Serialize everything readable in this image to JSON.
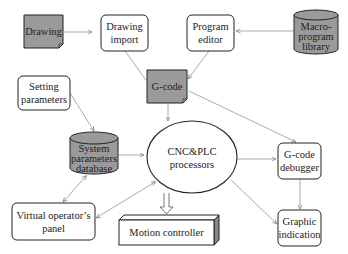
{
  "diagram": {
    "type": "flowchart",
    "nodes": {
      "drawing": {
        "label": [
          "Drawing"
        ],
        "shape": "document",
        "fill": "#9a9a9a"
      },
      "drawing_import": {
        "label": [
          "Drawing",
          "import"
        ],
        "shape": "rounded-rect",
        "fill": "#ffffff"
      },
      "program_editor": {
        "label": [
          "Program",
          "editor"
        ],
        "shape": "rounded-rect",
        "fill": "#ffffff"
      },
      "macro_library": {
        "label": [
          "Macro-",
          "program",
          "library"
        ],
        "shape": "cylinder",
        "fill": "#9a9a9a"
      },
      "gcode": {
        "label": [
          "G-code"
        ],
        "shape": "document",
        "fill": "#9a9a9a"
      },
      "setting_params": {
        "label": [
          "Setting",
          "parameters"
        ],
        "shape": "rounded-rect",
        "fill": "#ffffff"
      },
      "sys_db": {
        "label": [
          "System",
          "parameters",
          "database"
        ],
        "shape": "cylinder",
        "fill": "#9a9a9a"
      },
      "cnc_plc": {
        "label": [
          "CNC&PLC",
          "processors"
        ],
        "shape": "ellipse",
        "fill": "#ffffff"
      },
      "gcode_debugger": {
        "label": [
          "G-code",
          "debugger"
        ],
        "shape": "rounded-rect",
        "fill": "#ffffff"
      },
      "virtual_panel": {
        "label": [
          "Virtual operator’s",
          "panel"
        ],
        "shape": "rounded-rect",
        "fill": "#ffffff"
      },
      "motion_controller": {
        "label": [
          "Motion controller"
        ],
        "shape": "3d-box",
        "fill": "#ffffff"
      },
      "graphic_indication": {
        "label": [
          "Graphic",
          "indication"
        ],
        "shape": "rounded-rect",
        "fill": "#ffffff"
      }
    },
    "edges": [
      {
        "from": "drawing",
        "to": "drawing_import"
      },
      {
        "from": "macro_library",
        "to": "program_editor"
      },
      {
        "from": "drawing_import",
        "to": "gcode"
      },
      {
        "from": "program_editor",
        "to": "gcode"
      },
      {
        "from": "gcode",
        "to": "cnc_plc"
      },
      {
        "from": "gcode",
        "to": "gcode_debugger"
      },
      {
        "from": "setting_params",
        "to": "sys_db"
      },
      {
        "from": "sys_db",
        "to": "cnc_plc"
      },
      {
        "from": "sys_db",
        "to": "virtual_panel",
        "bidirectional": true
      },
      {
        "from": "cnc_plc",
        "to": "virtual_panel",
        "bidirectional": true
      },
      {
        "from": "cnc_plc",
        "to": "gcode_debugger"
      },
      {
        "from": "cnc_plc",
        "to": "graphic_indication"
      },
      {
        "from": "gcode_debugger",
        "to": "graphic_indication"
      },
      {
        "from": "cnc_plc",
        "to": "motion_controller",
        "style": "hollow-arrow"
      }
    ],
    "colors": {
      "stroke": "#222222",
      "gray_fill": "#9a9a9a",
      "arrow": "#9a9a9a"
    }
  }
}
